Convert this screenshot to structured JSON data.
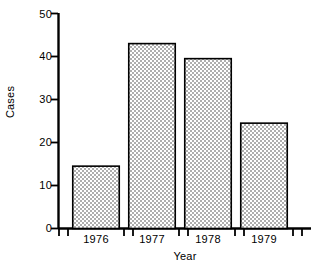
{
  "chart_data": {
    "type": "bar",
    "title": "",
    "subtitle": "",
    "xlabel": "Year",
    "ylabel": "Cases",
    "categories": [
      "1976",
      "1977",
      "1978",
      "1979"
    ],
    "values": [
      14.5,
      43,
      39.5,
      24.5
    ],
    "series": [
      {
        "name": "Cases",
        "values": [
          14.5,
          43,
          39.5,
          24.5
        ]
      }
    ],
    "ylim": [
      0,
      50
    ],
    "xlim": [
      0,
      4
    ],
    "yticks": [
      0,
      10,
      20,
      30,
      40,
      50
    ],
    "ytick_labels": [
      "0",
      "10",
      "20",
      "30",
      "40",
      "50"
    ],
    "grid": false,
    "legend": false,
    "legend_position": "none",
    "bar_fill": "#d9d9d9",
    "bar_fill_pattern": "stipple-dots",
    "bar_edge_color": "#000000",
    "axis_color": "#000000",
    "background": "#ffffff"
  },
  "axes": {
    "y_axis_name": "y-axis",
    "x_axis_name": "x-axis"
  }
}
